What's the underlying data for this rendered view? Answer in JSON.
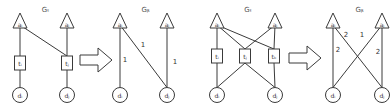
{
  "figure": {
    "panels": [
      {
        "id": "example-1",
        "tripartite": {
          "title": "G_t",
          "title_display": "Gₜ",
          "top_nodes": [
            {
              "id": "a1",
              "label": "aᵢ",
              "x": 20,
              "y": 22
            },
            {
              "id": "a2",
              "label": "aⱼ",
              "x": 67,
              "y": 22
            }
          ],
          "middle_nodes": [
            {
              "id": "t1",
              "label": "tᵢ",
              "x": 20,
              "y": 63
            },
            {
              "id": "t2",
              "label": "tⱼ",
              "x": 67,
              "y": 63
            }
          ],
          "bottom_nodes": [
            {
              "id": "d1",
              "label": "dᵢ",
              "x": 20,
              "y": 95
            },
            {
              "id": "d2",
              "label": "dⱼ",
              "x": 67,
              "y": 95
            }
          ],
          "edges": [
            [
              "a1",
              "t1"
            ],
            [
              "a1",
              "t2"
            ],
            [
              "a2",
              "t2"
            ],
            [
              "t1",
              "d1"
            ],
            [
              "t2",
              "d2"
            ]
          ]
        },
        "bipartite": {
          "title": "G_b",
          "title_display": "Gᵦ",
          "top_nodes": [
            {
              "id": "a1",
              "label": "aᵢ",
              "x": 120,
              "y": 22
            },
            {
              "id": "a2",
              "label": "aⱼ",
              "x": 167,
              "y": 22
            }
          ],
          "bottom_nodes": [
            {
              "id": "d1",
              "label": "dᵢ",
              "x": 120,
              "y": 95
            },
            {
              "id": "d2",
              "label": "dⱼ",
              "x": 167,
              "y": 95
            }
          ],
          "edges": [
            {
              "from": "a1",
              "to": "d1",
              "weight": "1"
            },
            {
              "from": "a1",
              "to": "d2",
              "weight": "1"
            },
            {
              "from": "a2",
              "to": "d2",
              "weight": "1"
            }
          ]
        }
      },
      {
        "id": "example-2",
        "tripartite": {
          "title": "G_t",
          "title_display": "Gₜ",
          "top_nodes": [
            {
              "id": "a1",
              "label": "aᵢ",
              "x": 217,
              "y": 22
            },
            {
              "id": "a2",
              "label": "aⱼ",
              "x": 275,
              "y": 22
            }
          ],
          "middle_nodes": [
            {
              "id": "t1",
              "label": "tᵢ",
              "x": 217,
              "y": 56
            },
            {
              "id": "t2",
              "label": "tⱼ",
              "x": 245,
              "y": 56
            },
            {
              "id": "t3",
              "label": "tₖ",
              "x": 274,
              "y": 56
            }
          ],
          "bottom_nodes": [
            {
              "id": "d1",
              "label": "dᵢ",
              "x": 217,
              "y": 95
            },
            {
              "id": "d2",
              "label": "dⱼ",
              "x": 275,
              "y": 95
            }
          ],
          "edges": [
            [
              "a1",
              "t1"
            ],
            [
              "a1",
              "t2"
            ],
            [
              "a1",
              "t3"
            ],
            [
              "a2",
              "t2"
            ],
            [
              "a2",
              "t3"
            ],
            [
              "t1",
              "d1"
            ],
            [
              "t2",
              "d1"
            ],
            [
              "t2",
              "d2"
            ],
            [
              "t3",
              "d2"
            ]
          ]
        },
        "bipartite": {
          "title": "G_b",
          "title_display": "Gᵦ",
          "top_nodes": [
            {
              "id": "a1",
              "label": "aᵢ",
              "x": 333,
              "y": 22
            },
            {
              "id": "a2",
              "label": "aⱼ",
              "x": 382,
              "y": 22
            }
          ],
          "bottom_nodes": [
            {
              "id": "d1",
              "label": "dᵢ",
              "x": 333,
              "y": 95
            },
            {
              "id": "d2",
              "label": "dⱼ",
              "x": 382,
              "y": 95
            }
          ],
          "edges": [
            {
              "from": "a1",
              "to": "d1",
              "weight": "2"
            },
            {
              "from": "a1",
              "to": "d2",
              "weight": "2"
            },
            {
              "from": "a2",
              "to": "d1",
              "weight": "1"
            },
            {
              "from": "a2",
              "to": "d2",
              "weight": "2"
            }
          ]
        }
      }
    ],
    "arrows": [
      {
        "id": "transform-arrow-1",
        "x": 80,
        "y": 60
      },
      {
        "id": "transform-arrow-2",
        "x": 289,
        "y": 58
      }
    ],
    "colors": {
      "stroke": "#3a3a3a",
      "text": "#333333",
      "background": "#ffffff"
    }
  }
}
